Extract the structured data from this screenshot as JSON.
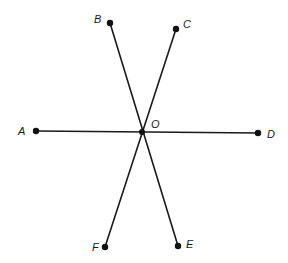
{
  "diagram": {
    "type": "geometry-rays",
    "center": "O",
    "points": [
      {
        "id": "A",
        "label": "A"
      },
      {
        "id": "B",
        "label": "B"
      },
      {
        "id": "C",
        "label": "C"
      },
      {
        "id": "D",
        "label": "D"
      },
      {
        "id": "E",
        "label": "E"
      },
      {
        "id": "F",
        "label": "F"
      },
      {
        "id": "O",
        "label": "O"
      }
    ],
    "lines": [
      {
        "name": "line-AD",
        "from": "A",
        "to": "D",
        "through": "O"
      },
      {
        "name": "line-BE",
        "from": "B",
        "to": "E",
        "through": "O"
      },
      {
        "name": "line-CF",
        "from": "C",
        "to": "F",
        "through": "O"
      }
    ],
    "colors": {
      "stroke": "#1a1a1a",
      "point": "#111111",
      "background": "#ffffff"
    }
  }
}
